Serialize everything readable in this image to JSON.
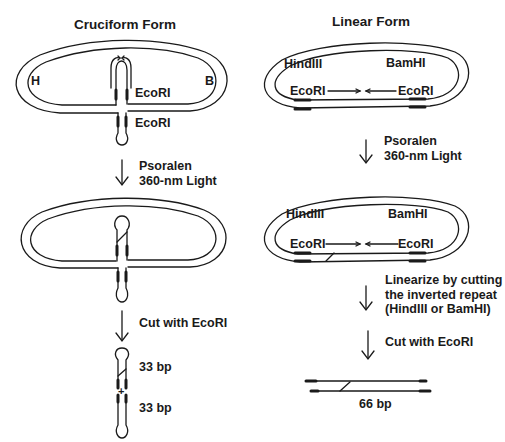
{
  "left_panel": {
    "title": "Cruciform Form",
    "plasmid_labels": {
      "h": "H",
      "b": "B",
      "ecori_top": "EcoRI",
      "ecori_bottom": "EcoRI"
    },
    "step1": {
      "line1": "Psoralen",
      "line2": "360-nm Light"
    },
    "step2": {
      "line1": "Cut with EcoRI"
    },
    "products": {
      "fragment1": "33 bp",
      "plus": "+",
      "fragment2": "33 bp"
    }
  },
  "right_panel": {
    "title": "Linear Form",
    "plasmid1": {
      "hind": "HindIII",
      "bam": "BamHI",
      "ecori_left": "EcoRI",
      "ecori_right": "EcoRI"
    },
    "step1": {
      "line1": "Psoralen",
      "line2": "360-nm Light"
    },
    "plasmid2": {
      "hind": "HindIII",
      "bam": "BamHI",
      "ecori_left": "EcoRI",
      "ecori_right": "EcoRI"
    },
    "step2": {
      "line1": "Linearize by cutting",
      "line2": "the inverted repeat",
      "line3": "(HindIII or BamHI)"
    },
    "step3": {
      "line1": "Cut with EcoRI"
    },
    "product": {
      "size": "66 bp"
    }
  },
  "colors": {
    "ink": "#1a1a1a",
    "background": "#ffffff"
  }
}
